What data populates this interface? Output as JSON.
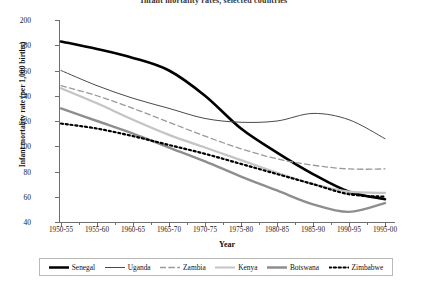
{
  "chart_data": {
    "type": "line",
    "title": "Infant mortality rates, selected countries",
    "xlabel": "Year",
    "ylabel": "Infant mortality rate (per 1,000 births)",
    "ylim": [
      40,
      200
    ],
    "ytick_step": 20,
    "yticks": [
      200,
      180,
      160,
      140,
      120,
      100,
      80,
      60,
      40
    ],
    "grid": false,
    "legend_position": "bottom",
    "categories": [
      "1950-55",
      "1955-60",
      "1960-65",
      "1965-70",
      "1970-75",
      "1975-80",
      "1980-85",
      "1985-90",
      "1990-95",
      "1995-00"
    ],
    "series": [
      {
        "name": "Senegal",
        "color": "#000000",
        "width": 2.6,
        "dash": "none",
        "values": [
          183,
          177,
          170,
          160,
          140,
          114,
          95,
          78,
          64,
          58
        ]
      },
      {
        "name": "Uganda",
        "color": "#4a4a4a",
        "width": 1.0,
        "dash": "none",
        "values": [
          160,
          148,
          138,
          130,
          122,
          119,
          120,
          126,
          121,
          106
        ]
      },
      {
        "name": "Zambia",
        "color": "#9a9a9a",
        "width": 1.3,
        "dash": "dashed",
        "values": [
          148,
          140,
          130,
          119,
          108,
          98,
          90,
          85,
          82,
          82
        ]
      },
      {
        "name": "Kenya",
        "color": "#c4c4c4",
        "width": 2.2,
        "dash": "none",
        "values": [
          146,
          134,
          121,
          109,
          99,
          89,
          79,
          70,
          64,
          63
        ]
      },
      {
        "name": "Botswana",
        "color": "#8e8e8e",
        "width": 2.4,
        "dash": "none",
        "values": [
          130,
          120,
          110,
          99,
          88,
          76,
          65,
          54,
          48,
          55
        ]
      },
      {
        "name": "Zimbabwe",
        "color": "#000000",
        "width": 2.2,
        "dash": "dotted",
        "values": [
          118,
          114,
          108,
          101,
          94,
          86,
          78,
          70,
          62,
          60
        ]
      }
    ]
  },
  "legend": {
    "items": [
      {
        "label": "Senegal"
      },
      {
        "label": "Uganda"
      },
      {
        "label": "Zambia"
      },
      {
        "label": "Kenya"
      },
      {
        "label": "Botswana"
      },
      {
        "label": "Zimbabwe"
      }
    ]
  }
}
